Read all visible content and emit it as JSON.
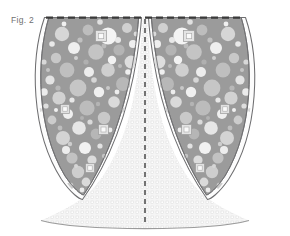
{
  "figure": {
    "label": "Fig. 2",
    "caption_position": "top-left",
    "type": "patent-cross-section-drawing",
    "background_color": "#ffffff"
  },
  "colors": {
    "label_text": "#6f6f6f",
    "outline_dark": "#58585a",
    "outline_mid": "#8d8d8f",
    "lobe_fill": "#9a9a9a",
    "particle_light": "#c9c9c9",
    "particle_white": "#f2f2f2",
    "particle_mid": "#b0b0b0",
    "particle_dark": "#8a8a8a",
    "rim_white": "#fdfdfd",
    "stipple_fill": "#f4f4f4",
    "stipple_dot": "#d5d5d5",
    "dashed_line": "#3a3a3a",
    "centerline": "#2e2e2e",
    "bottom_arc": "#9a9a9a"
  },
  "elements": {
    "top_edge": {
      "name": "top dashed boundary",
      "style": "dashed",
      "y": 17
    },
    "left_lobe": {
      "name": "left leaf-shaped body",
      "fill": "particle matrix"
    },
    "right_lobe": {
      "name": "right leaf-shaped body",
      "fill": "particle matrix"
    },
    "center_channel": {
      "name": "tapering central channel",
      "fill": "stipple"
    },
    "centerline": {
      "name": "vertical dashed axis of symmetry",
      "x": 145,
      "style": "dashed"
    },
    "bottom_region": {
      "name": "lower stippled arc region",
      "fill": "stipple"
    },
    "outer_rim": {
      "name": "double-line outer shell",
      "style": "double"
    },
    "square_inclusions": {
      "name": "square particle inclusions",
      "count": 6
    }
  },
  "geometry": {
    "width": 290,
    "height": 236,
    "axis_x": 145,
    "top_y": 17,
    "lobe_tip_y": 197,
    "arc_bottom_y": 228
  }
}
